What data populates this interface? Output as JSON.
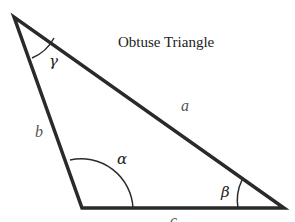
{
  "title": "Obtuse Triangle",
  "sides": {
    "a": "a",
    "b": "b",
    "c": "c"
  },
  "angles": {
    "alpha": "α",
    "beta": "β",
    "gamma": "γ"
  },
  "colors": {
    "stroke": "#2a2a2a",
    "side_label": "#555555",
    "text": "#222222"
  }
}
